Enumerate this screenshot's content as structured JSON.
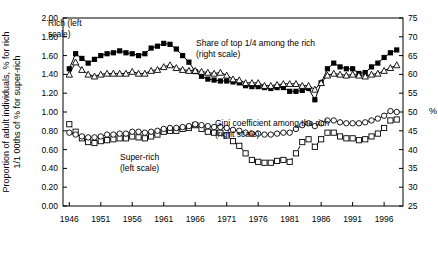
{
  "chart_data": {
    "type": "line",
    "title": "",
    "xlabel": "",
    "ylabel_left": "Proportion of adult individuals, % for rich 1/1 00ths of % for super-rich",
    "ylabel_right": "%",
    "xlim": [
      1945,
      1999
    ],
    "ylim_left": [
      0.0,
      2.0
    ],
    "ylim_right": [
      25,
      75
    ],
    "grid": false,
    "x_ticks": [
      "1946",
      "1951",
      "1956",
      "1961",
      "1966",
      "1971",
      "1976",
      "1981",
      "1986",
      "1991",
      "1996"
    ],
    "x_tick_values": [
      1946,
      1951,
      1956,
      1961,
      1966,
      1971,
      1976,
      1981,
      1986,
      1991,
      1996
    ],
    "y_ticks_left": [
      "0.00",
      "0.20",
      "0.40",
      "0.60",
      "0.80",
      "1.00",
      "1.20",
      "1.40",
      "1.60",
      "1.80",
      "2.00"
    ],
    "y_tick_values_left": [
      0.0,
      0.2,
      0.4,
      0.6,
      0.8,
      1.0,
      1.2,
      1.4,
      1.6,
      1.8,
      2.0
    ],
    "y_ticks_right": [
      "25",
      "30",
      "35",
      "40",
      "45",
      "50",
      "55",
      "60",
      "65",
      "70",
      "75"
    ],
    "y_tick_values_right": [
      25,
      30,
      35,
      40,
      45,
      50,
      55,
      60,
      65,
      70,
      75
    ],
    "annotations": [
      {
        "id": "rich-label",
        "text": "Rich (left",
        "text2": "scale)",
        "x": 48,
        "y": 26
      },
      {
        "id": "share-top-quarter-label",
        "text": "Share of top 1/4 among the rich",
        "text2": "(right scale)",
        "x": 196,
        "y": 46
      },
      {
        "id": "gini-label",
        "text": "Gini coefficient among the rich",
        "text2": "(right scale)",
        "x": 215,
        "y": 126
      },
      {
        "id": "super-rich-label",
        "text": "Super-rich",
        "text2": "(left scale)",
        "x": 120,
        "y": 160
      }
    ],
    "series": [
      {
        "name": "Rich (left scale)",
        "axis": "left",
        "marker": "filled-square",
        "line": "solid",
        "x": [
          1946,
          1947,
          1948,
          1949,
          1950,
          1951,
          1952,
          1953,
          1954,
          1955,
          1956,
          1957,
          1958,
          1959,
          1960,
          1961,
          1962,
          1963,
          1964,
          1965,
          1966,
          1967,
          1968,
          1969,
          1970,
          1971,
          1972,
          1973,
          1974,
          1975,
          1976,
          1977,
          1978,
          1979,
          1980,
          1981,
          1982,
          1983,
          1984,
          1985,
          1986,
          1987,
          1988,
          1989,
          1990,
          1991,
          1992,
          1993,
          1994,
          1995,
          1996,
          1997,
          1998
        ],
        "y": [
          1.46,
          1.62,
          1.57,
          1.52,
          1.56,
          1.6,
          1.62,
          1.63,
          1.65,
          1.63,
          1.62,
          1.6,
          1.62,
          1.68,
          1.7,
          1.73,
          1.72,
          1.67,
          1.6,
          1.53,
          1.43,
          1.38,
          1.35,
          1.34,
          1.33,
          1.33,
          1.32,
          1.31,
          1.28,
          1.27,
          1.27,
          1.26,
          1.25,
          1.26,
          1.26,
          1.22,
          1.22,
          1.23,
          1.25,
          1.13,
          1.31,
          1.46,
          1.52,
          1.48,
          1.46,
          1.46,
          1.41,
          1.42,
          1.48,
          1.52,
          1.58,
          1.63,
          1.66
        ]
      },
      {
        "name": "Share of top 1/4 among the rich (right scale)",
        "axis": "right",
        "marker": "open-triangle",
        "line": "solid",
        "x": [
          1946,
          1947,
          1948,
          1949,
          1950,
          1951,
          1952,
          1953,
          1954,
          1955,
          1956,
          1957,
          1958,
          1959,
          1960,
          1961,
          1962,
          1963,
          1964,
          1965,
          1966,
          1967,
          1968,
          1969,
          1970,
          1971,
          1972,
          1973,
          1974,
          1975,
          1976,
          1977,
          1978,
          1979,
          1980,
          1981,
          1982,
          1983,
          1984,
          1985,
          1986,
          1987,
          1988,
          1989,
          1990,
          1991,
          1992,
          1993,
          1994,
          1995,
          1996,
          1997,
          1998
        ],
        "y": [
          1.4,
          1.53,
          1.45,
          1.4,
          1.38,
          1.4,
          1.41,
          1.41,
          1.41,
          1.41,
          1.43,
          1.41,
          1.41,
          1.44,
          1.45,
          1.48,
          1.5,
          1.47,
          1.45,
          1.44,
          1.44,
          1.43,
          1.42,
          1.41,
          1.42,
          1.39,
          1.35,
          1.34,
          1.31,
          1.31,
          1.31,
          1.28,
          1.28,
          1.29,
          1.3,
          1.3,
          1.3,
          1.28,
          1.28,
          1.24,
          1.31,
          1.39,
          1.41,
          1.4,
          1.39,
          1.4,
          1.39,
          1.38,
          1.4,
          1.41,
          1.44,
          1.47,
          1.5
        ]
      },
      {
        "name": "Super-rich (left scale)",
        "axis": "left",
        "marker": "open-square",
        "line": "dashed",
        "x": [
          1946,
          1947,
          1948,
          1949,
          1950,
          1951,
          1952,
          1953,
          1954,
          1955,
          1956,
          1957,
          1958,
          1959,
          1960,
          1961,
          1962,
          1963,
          1964,
          1965,
          1966,
          1967,
          1968,
          1969,
          1970,
          1971,
          1972,
          1973,
          1974,
          1975,
          1976,
          1977,
          1978,
          1979,
          1980,
          1981,
          1982,
          1983,
          1984,
          1985,
          1986,
          1987,
          1988,
          1989,
          1990,
          1991,
          1992,
          1993,
          1994,
          1995,
          1996,
          1997,
          1998
        ],
        "y": [
          0.87,
          0.79,
          0.72,
          0.68,
          0.67,
          0.69,
          0.7,
          0.71,
          0.72,
          0.72,
          0.74,
          0.73,
          0.72,
          0.74,
          0.76,
          0.79,
          0.8,
          0.8,
          0.82,
          0.83,
          0.86,
          0.82,
          0.79,
          0.78,
          0.78,
          0.75,
          0.69,
          0.64,
          0.56,
          0.49,
          0.47,
          0.46,
          0.46,
          0.48,
          0.49,
          0.47,
          0.56,
          0.68,
          0.71,
          0.63,
          0.71,
          0.78,
          0.78,
          0.74,
          0.72,
          0.72,
          0.7,
          0.71,
          0.74,
          0.77,
          0.83,
          0.91,
          0.92
        ]
      },
      {
        "name": "Gini coefficient among the rich (right scale)",
        "axis": "right",
        "marker": "open-circle",
        "line": "solid",
        "x": [
          1946,
          1947,
          1948,
          1949,
          1950,
          1951,
          1952,
          1953,
          1954,
          1955,
          1956,
          1957,
          1958,
          1959,
          1960,
          1961,
          1962,
          1963,
          1964,
          1965,
          1966,
          1967,
          1968,
          1969,
          1970,
          1971,
          1972,
          1973,
          1974,
          1975,
          1976,
          1977,
          1978,
          1979,
          1980,
          1981,
          1982,
          1983,
          1984,
          1985,
          1986,
          1987,
          1988,
          1989,
          1990,
          1991,
          1992,
          1993,
          1994,
          1995,
          1996,
          1997,
          1998
        ],
        "y": [
          0.78,
          0.76,
          0.74,
          0.73,
          0.73,
          0.74,
          0.76,
          0.76,
          0.77,
          0.77,
          0.79,
          0.79,
          0.78,
          0.79,
          0.8,
          0.82,
          0.83,
          0.83,
          0.84,
          0.85,
          0.87,
          0.86,
          0.85,
          0.84,
          0.84,
          0.83,
          0.81,
          0.8,
          0.78,
          0.77,
          0.77,
          0.76,
          0.76,
          0.77,
          0.78,
          0.78,
          0.82,
          0.86,
          0.88,
          0.85,
          0.88,
          0.91,
          0.91,
          0.89,
          0.88,
          0.88,
          0.88,
          0.89,
          0.91,
          0.93,
          0.96,
          1.01,
          1.0
        ]
      }
    ]
  }
}
